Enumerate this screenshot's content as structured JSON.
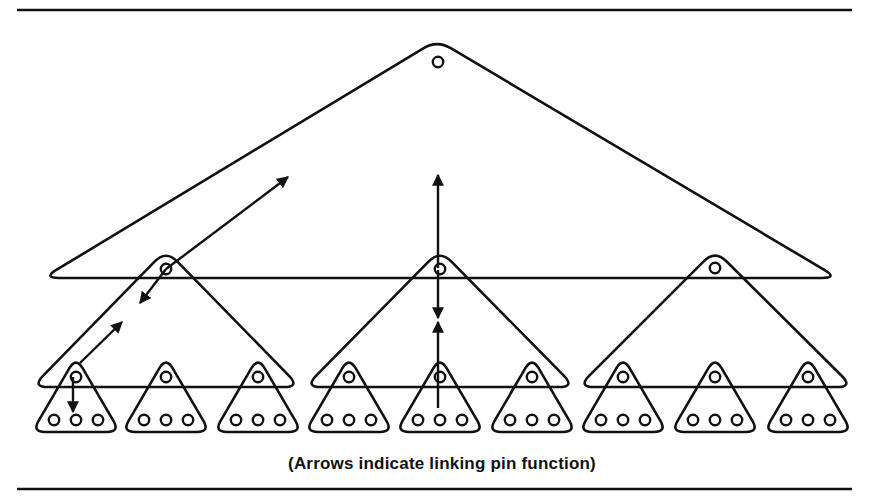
{
  "figure": {
    "caption": "(Arrows indicate linking pin function)",
    "colors": {
      "ink": "#111111",
      "background": "#ffffff"
    },
    "rules": {
      "top_y": 10,
      "bottom_y": 489,
      "x1": 17,
      "x2": 852
    },
    "levels": [
      {
        "name": "top",
        "groups": [
          {
            "apex": [
              437,
              40
            ],
            "base_y": 278,
            "left": 43,
            "right": 838,
            "pins": [
              [
                438,
                62
              ]
            ]
          }
        ]
      },
      {
        "name": "middle",
        "groups": [
          {
            "apex": [
              166,
              250
            ],
            "base_y": 387,
            "left": 32,
            "right": 300,
            "top_pin": [
              166,
              269
            ]
          },
          {
            "apex": [
              440,
              250
            ],
            "base_y": 387,
            "left": 305,
            "right": 575,
            "top_pin": [
              440,
              269
            ]
          },
          {
            "apex": [
              715,
              250
            ],
            "base_y": 387,
            "left": 578,
            "right": 853,
            "top_pin": [
              715,
              268
            ]
          }
        ]
      },
      {
        "name": "bottom",
        "groups": [
          {
            "cx": 76
          },
          {
            "cx": 166
          },
          {
            "cx": 258
          },
          {
            "cx": 349
          },
          {
            "cx": 440
          },
          {
            "cx": 532
          },
          {
            "cx": 623
          },
          {
            "cx": 715
          },
          {
            "cx": 808
          }
        ],
        "apex_y": 357,
        "base_y": 432,
        "half_width": 44,
        "top_pin_y": 377,
        "bottom_pin_y": 420,
        "pin_spacing": 22
      }
    ],
    "arrows": [
      {
        "from": [
          166,
          269
        ],
        "to": [
          288,
          177
        ],
        "head": "end"
      },
      {
        "from": [
          166,
          269
        ],
        "to": [
          140,
          303
        ],
        "head": "end"
      },
      {
        "from": [
          80,
          363
        ],
        "to": [
          122,
          322
        ],
        "head": "end"
      },
      {
        "from": [
          73,
          377
        ],
        "to": [
          73,
          412
        ],
        "head": "end"
      },
      {
        "from": [
          438,
          268
        ],
        "to": [
          438,
          175
        ],
        "head": "end"
      },
      {
        "from": [
          438,
          270
        ],
        "to": [
          438,
          318
        ],
        "head": "end"
      },
      {
        "from": [
          438,
          408
        ],
        "to": [
          438,
          322
        ],
        "head": "end"
      }
    ]
  }
}
